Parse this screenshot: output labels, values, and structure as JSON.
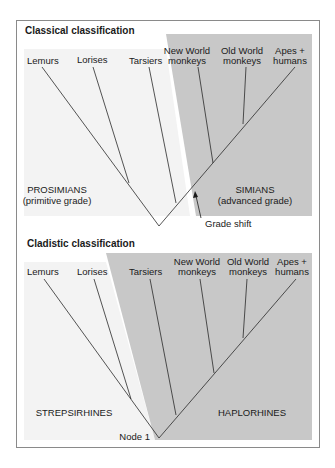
{
  "colors": {
    "light_panel": "#f3f3f3",
    "grey_panel": "#c8c8c8",
    "line": "#2a2a2a",
    "frame": "#8a8a8a"
  },
  "panels": [
    {
      "id": "classical",
      "title": "Classical classification",
      "taxa": [
        {
          "label": [
            "Lemurs"
          ]
        },
        {
          "label": [
            "Lorises"
          ]
        },
        {
          "label": [
            "Tarsiers"
          ]
        },
        {
          "label": [
            "New World",
            "monkeys"
          ]
        },
        {
          "label": [
            "Old World",
            "monkeys"
          ]
        },
        {
          "label": [
            "Apes +",
            "humans"
          ]
        }
      ],
      "groups": [
        {
          "label": [
            "PROSIMIANS",
            "(primitive grade)"
          ]
        },
        {
          "label": [
            "SIMIANS",
            "(advanced grade)"
          ]
        }
      ],
      "annotation": "Grade shift"
    },
    {
      "id": "cladistic",
      "title": "Cladistic classification",
      "taxa": [
        {
          "label": [
            "Lemurs"
          ]
        },
        {
          "label": [
            "Lorises"
          ]
        },
        {
          "label": [
            "Tarsiers"
          ]
        },
        {
          "label": [
            "New World",
            "monkeys"
          ]
        },
        {
          "label": [
            "Old World",
            "monkeys"
          ]
        },
        {
          "label": [
            "Apes +",
            "humans"
          ]
        }
      ],
      "groups": [
        {
          "label": [
            "STREPSIRHINES"
          ]
        },
        {
          "label": [
            "HAPLORHINES"
          ]
        }
      ],
      "annotation": "Node 1"
    }
  ]
}
